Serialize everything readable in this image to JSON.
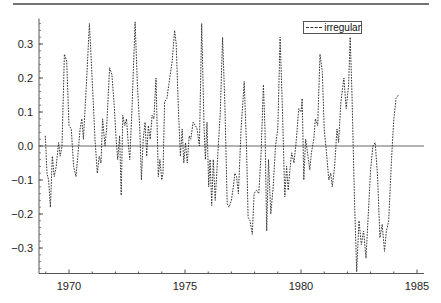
{
  "chart_data": {
    "type": "line",
    "title": "",
    "xlabel": "",
    "ylabel": "",
    "xlim": [
      1968.8,
      1985.6
    ],
    "ylim": [
      -0.375,
      0.375
    ],
    "x_ticks": [
      1970,
      1975,
      1980,
      1985
    ],
    "x_tick_labels": [
      "1970",
      "1975",
      "1980",
      "1985"
    ],
    "y_ticks": [
      -0.3,
      -0.2,
      -0.1,
      0.0,
      0.1,
      0.2,
      0.3
    ],
    "y_tick_labels": [
      "-0.3",
      "-0.2",
      "-0.1",
      "0.0",
      "0.1",
      "0.2",
      "0.3"
    ],
    "grid": false,
    "reference_line": {
      "y": 0.0
    },
    "legend": {
      "position": "upper right",
      "entries": [
        "irregular"
      ]
    },
    "series": [
      {
        "name": "irregular",
        "style": "dashed",
        "points": [
          [
            1968.98,
            0.03
          ],
          [
            1969.05,
            -0.08
          ],
          [
            1969.12,
            -0.1
          ],
          [
            1969.2,
            -0.18
          ],
          [
            1969.28,
            -0.03
          ],
          [
            1969.36,
            -0.09
          ],
          [
            1969.45,
            -0.06
          ],
          [
            1969.55,
            0.01
          ],
          [
            1969.62,
            -0.03
          ],
          [
            1969.7,
            0.0
          ],
          [
            1969.8,
            0.27
          ],
          [
            1969.9,
            0.25
          ],
          [
            1970.0,
            0.06
          ],
          [
            1970.1,
            0.05
          ],
          [
            1970.2,
            -0.06
          ],
          [
            1970.3,
            -0.09
          ],
          [
            1970.38,
            -0.03
          ],
          [
            1970.48,
            0.05
          ],
          [
            1970.55,
            0.08
          ],
          [
            1970.62,
            0.02
          ],
          [
            1970.75,
            0.18
          ],
          [
            1970.88,
            0.36
          ],
          [
            1970.96,
            0.25
          ],
          [
            1971.05,
            0.12
          ],
          [
            1971.12,
            0.02
          ],
          [
            1971.22,
            -0.08
          ],
          [
            1971.3,
            -0.03
          ],
          [
            1971.38,
            -0.05
          ],
          [
            1971.45,
            0.08
          ],
          [
            1971.55,
            0.0
          ],
          [
            1971.62,
            0.05
          ],
          [
            1971.75,
            0.23
          ],
          [
            1971.85,
            0.21
          ],
          [
            1971.95,
            0.12
          ],
          [
            1972.02,
            0.03
          ],
          [
            1972.1,
            -0.04
          ],
          [
            1972.18,
            0.03
          ],
          [
            1972.25,
            -0.145
          ],
          [
            1972.32,
            0.09
          ],
          [
            1972.4,
            0.06
          ],
          [
            1972.48,
            0.08
          ],
          [
            1972.55,
            0.01
          ],
          [
            1972.62,
            -0.04
          ],
          [
            1972.72,
            0.12
          ],
          [
            1972.85,
            0.365
          ],
          [
            1972.95,
            0.18
          ],
          [
            1973.05,
            0.05
          ],
          [
            1973.12,
            -0.1
          ],
          [
            1973.2,
            0.02
          ],
          [
            1973.28,
            0.07
          ],
          [
            1973.35,
            -0.03
          ],
          [
            1973.42,
            0.06
          ],
          [
            1973.5,
            0.02
          ],
          [
            1973.58,
            0.09
          ],
          [
            1973.66,
            0.08
          ],
          [
            1973.75,
            0.2
          ],
          [
            1973.85,
            -0.09
          ],
          [
            1973.92,
            -0.04
          ],
          [
            1974.0,
            -0.1
          ],
          [
            1974.05,
            -0.08
          ],
          [
            1974.12,
            0.13
          ],
          [
            1974.22,
            0.14
          ],
          [
            1974.3,
            0.18
          ],
          [
            1974.45,
            0.25
          ],
          [
            1974.55,
            0.34
          ],
          [
            1974.62,
            0.3
          ],
          [
            1974.72,
            0.1
          ],
          [
            1974.8,
            -0.03
          ],
          [
            1974.88,
            0.05
          ],
          [
            1974.95,
            -0.05
          ],
          [
            1975.02,
            0.01
          ],
          [
            1975.1,
            -0.05
          ],
          [
            1975.18,
            0.03
          ],
          [
            1975.25,
            0.02
          ],
          [
            1975.35,
            0.07
          ],
          [
            1975.45,
            0.06
          ],
          [
            1975.52,
            0.05
          ],
          [
            1975.62,
            0.0
          ],
          [
            1975.72,
            0.36
          ],
          [
            1975.82,
            0.06
          ],
          [
            1975.88,
            -0.04
          ],
          [
            1975.95,
            0.07
          ],
          [
            1976.02,
            -0.12
          ],
          [
            1976.08,
            -0.04
          ],
          [
            1976.15,
            -0.175
          ],
          [
            1976.22,
            -0.04
          ],
          [
            1976.3,
            -0.16
          ],
          [
            1976.42,
            -0.02
          ],
          [
            1976.52,
            0.1
          ],
          [
            1976.62,
            0.32
          ],
          [
            1976.72,
            0.12
          ],
          [
            1976.82,
            -0.17
          ],
          [
            1976.9,
            -0.18
          ],
          [
            1977.0,
            -0.16
          ],
          [
            1977.08,
            -0.12
          ],
          [
            1977.15,
            -0.08
          ],
          [
            1977.22,
            -0.09
          ],
          [
            1977.3,
            -0.14
          ],
          [
            1977.42,
            0.05
          ],
          [
            1977.55,
            0.19
          ],
          [
            1977.65,
            0.0
          ],
          [
            1977.72,
            -0.21
          ],
          [
            1977.8,
            -0.22
          ],
          [
            1977.9,
            -0.26
          ],
          [
            1977.98,
            -0.14
          ],
          [
            1978.08,
            -0.13
          ],
          [
            1978.18,
            -0.14
          ],
          [
            1978.28,
            -0.02
          ],
          [
            1978.38,
            0.18
          ],
          [
            1978.45,
            0.05
          ],
          [
            1978.52,
            -0.25
          ],
          [
            1978.6,
            -0.04
          ],
          [
            1978.7,
            -0.2
          ],
          [
            1978.8,
            -0.12
          ],
          [
            1978.9,
            0.0
          ],
          [
            1979.0,
            0.05
          ],
          [
            1979.1,
            0.32
          ],
          [
            1979.2,
            0.11
          ],
          [
            1979.3,
            -0.15
          ],
          [
            1979.38,
            -0.06
          ],
          [
            1979.45,
            -0.13
          ],
          [
            1979.52,
            -0.07
          ],
          [
            1979.6,
            -0.02
          ],
          [
            1979.7,
            -0.05
          ],
          [
            1979.8,
            0.02
          ],
          [
            1979.9,
            0.11
          ],
          [
            1980.0,
            0.1
          ],
          [
            1980.05,
            0.14
          ],
          [
            1980.12,
            -0.1
          ],
          [
            1980.2,
            0.02
          ],
          [
            1980.3,
            -0.03
          ],
          [
            1980.38,
            -0.07
          ],
          [
            1980.45,
            -0.02
          ],
          [
            1980.55,
            0.02
          ],
          [
            1980.62,
            0.08
          ],
          [
            1980.72,
            0.06
          ],
          [
            1980.82,
            0.27
          ],
          [
            1980.92,
            0.22
          ],
          [
            1981.0,
            0.05
          ],
          [
            1981.1,
            -0.02
          ],
          [
            1981.2,
            -0.1
          ],
          [
            1981.28,
            -0.08
          ],
          [
            1981.35,
            -0.12
          ],
          [
            1981.45,
            -0.06
          ],
          [
            1981.55,
            0.05
          ],
          [
            1981.62,
            0.01
          ],
          [
            1981.72,
            0.13
          ],
          [
            1981.85,
            0.2
          ],
          [
            1981.95,
            0.11
          ],
          [
            1982.05,
            0.18
          ],
          [
            1982.12,
            0.32
          ],
          [
            1982.2,
            0.15
          ],
          [
            1982.3,
            -0.15
          ],
          [
            1982.4,
            -0.37
          ],
          [
            1982.5,
            -0.22
          ],
          [
            1982.6,
            -0.29
          ],
          [
            1982.7,
            -0.25
          ],
          [
            1982.8,
            -0.33
          ],
          [
            1982.9,
            -0.2
          ],
          [
            1983.0,
            -0.07
          ],
          [
            1983.1,
            0.0
          ],
          [
            1983.2,
            0.01
          ],
          [
            1983.3,
            -0.09
          ],
          [
            1983.4,
            -0.27
          ],
          [
            1983.5,
            -0.23
          ],
          [
            1983.6,
            -0.31
          ],
          [
            1983.68,
            -0.25
          ],
          [
            1983.78,
            -0.22
          ],
          [
            1983.9,
            -0.04
          ],
          [
            1984.0,
            0.08
          ],
          [
            1984.1,
            0.14
          ],
          [
            1984.2,
            0.15
          ]
        ]
      }
    ]
  },
  "legend": {
    "label": "irregular"
  }
}
